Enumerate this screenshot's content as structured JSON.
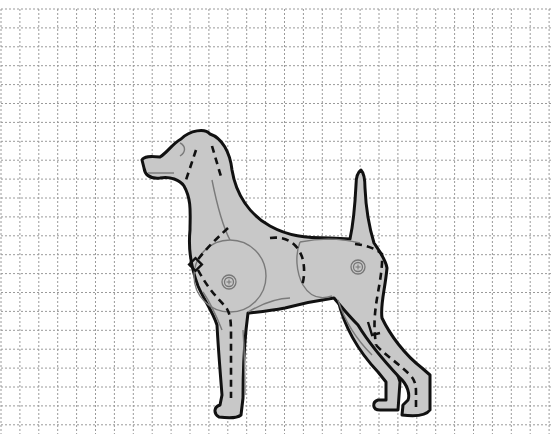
{
  "figure": {
    "title": "Dog template on grid",
    "description": "Side-view dog silhouette with dashed cut/fold lines and joint pivots on a square grid",
    "colors": {
      "background": "#ffffff",
      "grid": "#9a9a9a",
      "body_fill": "#c8c8c8",
      "outline": "#111111",
      "contour": "#7a7a7a"
    },
    "grid": {
      "origin_x": 1,
      "origin_y": 9,
      "cell_size": 18.9,
      "columns": 29,
      "rows": 23,
      "style": "dotted"
    },
    "parts": [
      {
        "name": "head-neck",
        "label": "Head and neck"
      },
      {
        "name": "chest-foreleg",
        "label": "Chest with front leg"
      },
      {
        "name": "hindquarter",
        "label": "Hindquarter with back legs"
      },
      {
        "name": "tail",
        "label": "Tail"
      }
    ],
    "joints": [
      {
        "name": "front-pivot",
        "x": 229,
        "y": 282
      },
      {
        "name": "rear-pivot",
        "x": 358,
        "y": 267
      }
    ]
  }
}
